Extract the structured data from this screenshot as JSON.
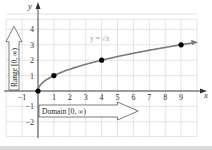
{
  "chart_data": {
    "type": "line",
    "title": "",
    "function_label": "y = √x",
    "xlabel": "x",
    "ylabel": "y",
    "x_ticks": [
      -1,
      1,
      2,
      3,
      4,
      5,
      6,
      7,
      8,
      9
    ],
    "y_ticks": [
      -2,
      -1,
      1,
      2,
      3,
      4
    ],
    "x_tick_labels": [
      "−1",
      "1",
      "2",
      "3",
      "4",
      "5",
      "6",
      "7",
      "8",
      "9"
    ],
    "y_tick_labels": [
      "−2",
      "−1",
      "1",
      "2",
      "3",
      "4"
    ],
    "xlim": [
      -2,
      10
    ],
    "ylim": [
      -3,
      5
    ],
    "grid": true,
    "series": [
      {
        "name": "y = √x",
        "function": "sqrt",
        "x_range": [
          0,
          10
        ],
        "points": [
          {
            "x": 0,
            "y": 0
          },
          {
            "x": 1,
            "y": 1
          },
          {
            "x": 4,
            "y": 2
          },
          {
            "x": 9,
            "y": 3
          }
        ]
      }
    ],
    "annotations": [
      {
        "text": "Domain [0, ∞)",
        "type": "arrow-right",
        "position": "below x-axis"
      },
      {
        "text": "Range [0, ∞)",
        "type": "arrow-up",
        "position": "left of y-axis"
      }
    ]
  },
  "labels": {
    "x_axis": "x",
    "y_axis": "y",
    "function": "y = √x",
    "domain": "Domain [0, ∞)",
    "range": "Range [0, ∞)"
  },
  "colors": {
    "grid": "#d8d8d8",
    "axis": "#333333",
    "curve": "#7a7a7a",
    "point": "#000000",
    "function_label": "#9a9a9a",
    "band": "#d9d9d9"
  }
}
